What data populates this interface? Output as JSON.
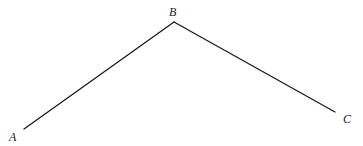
{
  "diagram": {
    "type": "polyline",
    "points": [
      {
        "label": "A"
      },
      {
        "label": "B"
      },
      {
        "label": "C"
      }
    ],
    "segments": [
      {
        "from": "A",
        "to": "B"
      },
      {
        "from": "B",
        "to": "C"
      }
    ],
    "colors": {
      "line": "#1a1a1a",
      "label": "#222222",
      "background": "#ffffff"
    }
  }
}
